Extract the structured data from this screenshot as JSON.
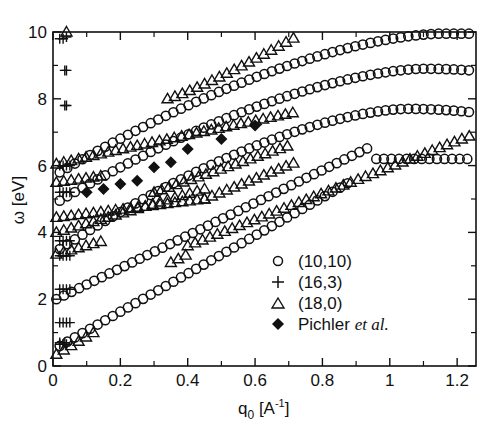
{
  "chart_data": {
    "type": "scatter",
    "title": "",
    "xlabel": "q0 [A^-1]",
    "xlabel_parts": {
      "main": "q",
      "sub": "0",
      "unit_open": " [A",
      "sup": "-1",
      "unit_close": "]"
    },
    "ylabel": "ω [eV]",
    "xlim": [
      0,
      1.256
    ],
    "ylim": [
      0,
      10
    ],
    "xticks": [
      0,
      0.2,
      0.4,
      0.6,
      0.8,
      1,
      1.2
    ],
    "xtick_labels": [
      "0",
      "0.2",
      "0.4",
      "0.6",
      "0.8",
      "1",
      "1.2"
    ],
    "xminor_ticks": [
      0.1,
      0.3,
      0.5,
      0.7,
      0.9,
      1.1
    ],
    "yticks": [
      0,
      2,
      4,
      6,
      8,
      10
    ],
    "ytick_labels": [
      "0",
      "2",
      "4",
      "6",
      "8",
      "10"
    ],
    "yminor_ticks": [
      1,
      3,
      5,
      7,
      9
    ],
    "grid": false,
    "legend_position": "lower right (inside)",
    "legend": [
      {
        "marker": "circle-open",
        "label": "(10,10)"
      },
      {
        "marker": "plus",
        "label": "(16,3)"
      },
      {
        "marker": "triangle-open",
        "label": "(18,0)"
      },
      {
        "marker": "diamond-filled",
        "label": "Pichler ",
        "label_em": "et al."
      }
    ],
    "series": [
      {
        "name": "(10,10)",
        "marker": "circle-open",
        "bands": [
          {
            "q_start": 0.02,
            "q_end": 0.88,
            "step": 0.0225,
            "w0": 0.6,
            "w1": 5.5,
            "curve": "linear-ish"
          },
          {
            "q_start": 0.01,
            "q_end": 0.95,
            "step": 0.0225,
            "w0": 2.0,
            "w1": 6.6,
            "curve": "linear-ish"
          },
          {
            "q_start": 0.96,
            "q_end": 1.24,
            "step": 0.0225,
            "w0": 6.2,
            "w1": 6.2,
            "curve": "flat"
          },
          {
            "q_start": 0.02,
            "q_end": 1.24,
            "step": 0.0225,
            "w0": 3.5,
            "w1": 7.6,
            "peak_q": 1.05,
            "peak_w": 7.7,
            "curve": "arc"
          },
          {
            "q_start": 0.02,
            "q_end": 1.24,
            "step": 0.0225,
            "w0": 4.95,
            "w1": 8.85,
            "peak_q": 1.1,
            "peak_w": 8.9,
            "curve": "arc"
          },
          {
            "q_start": 0.02,
            "q_end": 1.24,
            "step": 0.0225,
            "w0": 5.8,
            "w1": 9.95,
            "peak_q": 1.15,
            "peak_w": 9.95,
            "curve": "arc"
          }
        ]
      },
      {
        "name": "(16,3)",
        "marker": "plus",
        "points": [
          [
            0.02,
            0.65
          ],
          [
            0.03,
            0.65
          ],
          [
            0.04,
            0.65
          ],
          [
            0.02,
            0.7
          ],
          [
            0.035,
            0.7
          ],
          [
            0.02,
            1.3
          ],
          [
            0.03,
            1.3
          ],
          [
            0.04,
            1.3
          ],
          [
            0.05,
            1.3
          ],
          [
            0.02,
            2.3
          ],
          [
            0.03,
            2.3
          ],
          [
            0.04,
            2.3
          ],
          [
            0.05,
            2.3
          ],
          [
            0.02,
            3.3
          ],
          [
            0.03,
            3.3
          ],
          [
            0.04,
            3.3
          ],
          [
            0.05,
            3.3
          ],
          [
            0.02,
            3.75
          ],
          [
            0.03,
            3.75
          ],
          [
            0.04,
            3.75
          ],
          [
            0.05,
            3.75
          ],
          [
            0.02,
            5.2
          ],
          [
            0.03,
            5.2
          ],
          [
            0.04,
            5.2
          ],
          [
            0.05,
            5.2
          ],
          [
            0.02,
            6.0
          ],
          [
            0.03,
            6.0
          ],
          [
            0.04,
            6.0
          ],
          [
            0.05,
            6.0
          ],
          [
            0.035,
            7.8
          ],
          [
            0.04,
            7.8
          ],
          [
            0.035,
            8.85
          ],
          [
            0.04,
            8.85
          ],
          [
            0.02,
            9.8
          ],
          [
            0.03,
            9.8
          ],
          [
            0.04,
            9.85
          ]
        ]
      },
      {
        "name": "(18,0)",
        "marker": "triangle-open",
        "bands": [
          {
            "q_start": 0.01,
            "q_end": 0.12,
            "step": 0.022,
            "w0": 0.35,
            "w1": 1.0,
            "curve": "linear-ish"
          },
          {
            "q_start": 0.35,
            "q_end": 0.4,
            "step": 0.022,
            "w0": 3.1,
            "w1": 3.35,
            "curve": "linear-ish"
          },
          {
            "q_start": 0.4,
            "q_end": 1.24,
            "step": 0.022,
            "w0": 3.6,
            "w1": 6.9,
            "curve": "linear-ish"
          },
          {
            "q_start": 0.01,
            "q_end": 0.15,
            "step": 0.022,
            "w0": 3.35,
            "w1": 3.75,
            "curve": "linear-ish"
          },
          {
            "q_start": 0.01,
            "q_end": 0.45,
            "step": 0.022,
            "w0": 4.0,
            "w1": 5.3,
            "curve": "linear-ish"
          },
          {
            "q_start": 0.01,
            "q_end": 0.45,
            "step": 0.022,
            "w0": 4.45,
            "w1": 5.0,
            "curve": "linear-ish"
          },
          {
            "q_start": 0.45,
            "q_end": 0.72,
            "step": 0.022,
            "w0": 5.0,
            "w1": 6.1,
            "curve": "linear-ish"
          },
          {
            "q_start": 0.01,
            "q_end": 0.15,
            "step": 0.022,
            "w0": 5.5,
            "w1": 5.7,
            "curve": "linear-ish"
          },
          {
            "q_start": 0.3,
            "q_end": 0.7,
            "step": 0.022,
            "w0": 5.2,
            "w1": 6.6,
            "curve": "linear-ish"
          },
          {
            "q_start": 0.01,
            "q_end": 0.25,
            "step": 0.022,
            "w0": 6.05,
            "w1": 6.6,
            "curve": "linear-ish"
          },
          {
            "q_start": 0.25,
            "q_end": 0.72,
            "step": 0.022,
            "w0": 6.6,
            "w1": 7.6,
            "curve": "linear-ish"
          },
          {
            "q_start": 0.34,
            "q_end": 0.72,
            "step": 0.022,
            "w0": 8.0,
            "w1": 9.85,
            "curve": "rising"
          },
          {
            "q_start": 0.04,
            "q_end": 0.04,
            "step": 0.022,
            "w0": 10.0,
            "w1": 10.0,
            "curve": "flat"
          }
        ]
      },
      {
        "name": "Pichler et al.",
        "marker": "diamond-filled",
        "points": [
          [
            0.1,
            5.2
          ],
          [
            0.15,
            5.3
          ],
          [
            0.2,
            5.45
          ],
          [
            0.25,
            5.55
          ],
          [
            0.3,
            5.95
          ],
          [
            0.35,
            6.1
          ],
          [
            0.4,
            6.5
          ],
          [
            0.5,
            6.8
          ],
          [
            0.6,
            7.2
          ]
        ]
      }
    ]
  }
}
